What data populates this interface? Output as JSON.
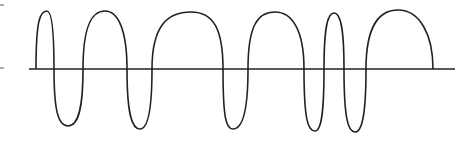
{
  "diagram": {
    "type": "waveform",
    "colors": {
      "stroke": "#222222",
      "background": "#ffffff",
      "tick": "#555555"
    },
    "baseline": {
      "x1": 29,
      "x2": 455,
      "y": 69
    },
    "left_ticks": [
      {
        "y": 5
      },
      {
        "y": 68
      }
    ],
    "wave_start": {
      "x": 36,
      "y": 69
    },
    "wave_end": {
      "x": 433,
      "y": 69
    },
    "peaks": [
      {
        "x": 47,
        "y": 11
      },
      {
        "x": 105,
        "y": 11
      },
      {
        "x": 191,
        "y": 12
      },
      {
        "x": 275,
        "y": 12
      },
      {
        "x": 334,
        "y": 13
      },
      {
        "x": 398,
        "y": 10
      }
    ],
    "troughs": [
      {
        "x": 68,
        "y": 126
      },
      {
        "x": 140,
        "y": 129
      },
      {
        "x": 233,
        "y": 129
      },
      {
        "x": 315,
        "y": 131
      },
      {
        "x": 355,
        "y": 132
      }
    ],
    "zero_crossings_x": [
      54,
      83,
      127,
      152,
      223,
      248,
      304,
      324,
      344,
      366
    ]
  }
}
